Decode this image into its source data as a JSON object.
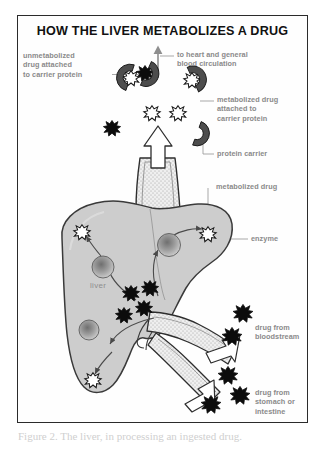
{
  "figure": {
    "title": "HOW THE LIVER METABOLIZES A DRUG",
    "caption": "Figure 2. The liver, in processing an ingested drug."
  },
  "labels": {
    "unmetabolized_carrier": "unmetabolized\ndrug attached\nto carrier protein",
    "to_heart": "to heart and general\nblood circulation",
    "metabolized_carrier": "metabolized drug\nattached to\ncarrier protein",
    "protein_carrier": "protein carrier",
    "metabolized_drug": "metabolized drug",
    "enzyme": "enzyme",
    "liver": "liver",
    "drug_bloodstream": "drug from\nbloodstream",
    "drug_stomach": "drug from\nstomach or\nintestine"
  },
  "colors": {
    "frame_border": "#2b2b2b",
    "title_text": "#111111",
    "label_text": "#8a8a8a",
    "liver_fill": "#cfcfcf",
    "liver_stroke": "#3a3a3a",
    "carrier_protein_fill": "#5a5a5a",
    "unmetabolized_drug_fill": "#000000",
    "metabolized_drug_fill": "#ffffff",
    "vessel_fill": "#e6e6e6",
    "enzyme_fill": "#9a9a9a",
    "leader_line": "#9a9a9a",
    "arrow_white_fill": "#ffffff"
  },
  "elements": {
    "icon_names": [
      "unmetabolized-drug-icon",
      "metabolized-drug-icon",
      "protein-carrier-icon",
      "enzyme-icon",
      "liver-shape",
      "hepatic-vein-vessel",
      "portal-vein-vessel",
      "hepatic-artery-vessel",
      "outflow-arrow-icon",
      "inflow-arrow-icon"
    ]
  }
}
